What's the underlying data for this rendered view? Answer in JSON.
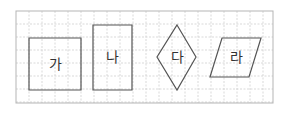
{
  "figure": {
    "grid": {
      "x": 16,
      "y": 11,
      "width": 257,
      "height": 92,
      "cell": 13,
      "border_color": "#b5b5b5",
      "line_color": "#cfcfcf"
    },
    "stroke_color": "#555555",
    "shapes": [
      {
        "id": "ga",
        "label": "가",
        "type": "square",
        "points": "29,38 81,38 81,90 29,90",
        "label_x": 55,
        "label_y": 69
      },
      {
        "id": "na",
        "label": "나",
        "type": "rectangle",
        "points": "93,25 132,25 132,90 93,90",
        "label_x": 112,
        "label_y": 62
      },
      {
        "id": "da",
        "label": "다",
        "type": "rhombus",
        "points": "177,25 196,57 177,90 157,57",
        "label_x": 177,
        "label_y": 62
      },
      {
        "id": "ra",
        "label": "라",
        "type": "parallelogram",
        "points": "222,38 261,38 249,77 210,77",
        "label_x": 236,
        "label_y": 62
      }
    ]
  }
}
